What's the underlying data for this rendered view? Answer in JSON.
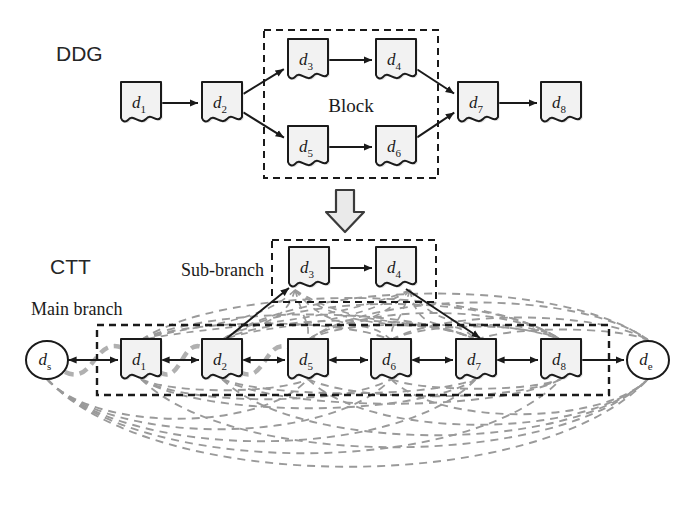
{
  "figure": {
    "background": "#ffffff",
    "ink": "#1a1a1a",
    "node_fill": "#f2f2f2",
    "dep_edge_color": "#9a9a9a",
    "arrow_fill": "#d8d8d8"
  },
  "sections": {
    "ddg": {
      "label": "DDG"
    },
    "ctt": {
      "label": "CTT"
    }
  },
  "ddg": {
    "block_label": "Block",
    "nodes": [
      {
        "id": "d1",
        "base": "d",
        "sub": "1",
        "x": 141,
        "y": 103
      },
      {
        "id": "d2",
        "base": "d",
        "sub": "2",
        "x": 222,
        "y": 103
      },
      {
        "id": "d3",
        "base": "d",
        "sub": "3",
        "x": 308,
        "y": 60
      },
      {
        "id": "d4",
        "base": "d",
        "sub": "4",
        "x": 396,
        "y": 60
      },
      {
        "id": "d5",
        "base": "d",
        "sub": "5",
        "x": 308,
        "y": 147
      },
      {
        "id": "d6",
        "base": "d",
        "sub": "6",
        "x": 396,
        "y": 147
      },
      {
        "id": "d7",
        "base": "d",
        "sub": "7",
        "x": 478,
        "y": 103
      },
      {
        "id": "d8",
        "base": "d",
        "sub": "8",
        "x": 561,
        "y": 103
      }
    ],
    "edges": [
      {
        "from": "d1",
        "to": "d2"
      },
      {
        "from": "d2",
        "to": "d3"
      },
      {
        "from": "d2",
        "to": "d5"
      },
      {
        "from": "d3",
        "to": "d4"
      },
      {
        "from": "d5",
        "to": "d6"
      },
      {
        "from": "d4",
        "to": "d7"
      },
      {
        "from": "d6",
        "to": "d7"
      },
      {
        "from": "d7",
        "to": "d8"
      }
    ],
    "block_box": {
      "x": 264,
      "y": 30,
      "w": 174,
      "h": 148
    }
  },
  "transform_arrow": {
    "name": "down-arrow",
    "x": 345,
    "y": 190
  },
  "ctt": {
    "main_branch_label": "Main branch",
    "sub_branch_label": "Sub-branch",
    "start_node": {
      "id": "ds",
      "base": "d",
      "sub": "s",
      "x": 47,
      "y": 360
    },
    "end_node": {
      "id": "de",
      "base": "d",
      "sub": "e",
      "x": 648,
      "y": 360
    },
    "main_nodes": [
      {
        "id": "d1",
        "base": "d",
        "sub": "1",
        "x": 141,
        "y": 360
      },
      {
        "id": "d2",
        "base": "d",
        "sub": "2",
        "x": 222,
        "y": 360
      },
      {
        "id": "d5",
        "base": "d",
        "sub": "5",
        "x": 308,
        "y": 360
      },
      {
        "id": "d6",
        "base": "d",
        "sub": "6",
        "x": 391,
        "y": 360
      },
      {
        "id": "d7",
        "base": "d",
        "sub": "7",
        "x": 476,
        "y": 360
      },
      {
        "id": "d8",
        "base": "d",
        "sub": "8",
        "x": 561,
        "y": 360
      }
    ],
    "sub_nodes": [
      {
        "id": "d3",
        "base": "d",
        "sub": "3",
        "x": 309,
        "y": 268
      },
      {
        "id": "d4",
        "base": "d",
        "sub": "4",
        "x": 396,
        "y": 268
      }
    ],
    "main_box": {
      "x": 97,
      "y": 325,
      "w": 512,
      "h": 70
    },
    "sub_box": {
      "x": 272,
      "y": 240,
      "w": 164,
      "h": 62
    },
    "chain_edges": [
      {
        "from": "ds",
        "to": "d1",
        "bidirectional": true
      },
      {
        "from": "d1",
        "to": "d2",
        "bidirectional": true
      },
      {
        "from": "d2",
        "to": "d5",
        "bidirectional": true
      },
      {
        "from": "d5",
        "to": "d6",
        "bidirectional": true
      },
      {
        "from": "d6",
        "to": "d7",
        "bidirectional": true
      },
      {
        "from": "d7",
        "to": "d8",
        "bidirectional": true
      },
      {
        "from": "d8",
        "to": "de",
        "bidirectional": false
      }
    ],
    "sub_edges": [
      {
        "from": "d2",
        "to": "d3"
      },
      {
        "from": "d3",
        "to": "d4"
      },
      {
        "from": "d4",
        "to": "d7"
      }
    ],
    "dependency_arcs_note": "gray dashed curved dependency edges spanning all node pairs"
  }
}
